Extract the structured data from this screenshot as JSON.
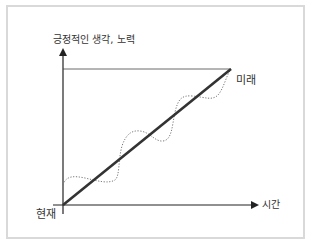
{
  "diagram": {
    "y_axis_label": "긍정적인 생각, 노력",
    "x_axis_label": "시간",
    "origin_label": "현재",
    "end_label": "미래",
    "lines": [
      {
        "name": "straight-progress",
        "style": "solid",
        "color": "#333333"
      },
      {
        "name": "wavy-progress",
        "style": "dotted",
        "color": "#777777"
      },
      {
        "name": "target-level",
        "style": "solid-thin",
        "color": "#444444"
      }
    ]
  }
}
